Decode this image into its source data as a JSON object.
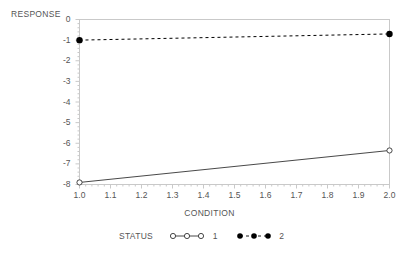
{
  "chart_data": {
    "type": "line",
    "title": "",
    "xlabel": "CONDITION",
    "ylabel": "RESPONSE",
    "xlim": [
      1.0,
      2.0
    ],
    "ylim": [
      -8,
      0
    ],
    "grid": false,
    "legend_position": "bottom",
    "legend_title": "STATUS",
    "x": [
      1.0,
      2.0
    ],
    "xticks": [
      "1.0",
      "1.1",
      "1.2",
      "1.3",
      "1.4",
      "1.5",
      "1.6",
      "1.7",
      "1.8",
      "1.9",
      "2.0"
    ],
    "yticks": [
      "0",
      "-1",
      "-2",
      "-3",
      "-4",
      "-5",
      "-6",
      "-7",
      "-8"
    ],
    "series": [
      {
        "name": "1",
        "values": [
          -7.9,
          -6.35
        ],
        "marker": "open-circle",
        "line": "solid",
        "color": "#333333"
      },
      {
        "name": "2",
        "values": [
          -1.0,
          -0.7
        ],
        "marker": "filled-circle",
        "line": "dashed",
        "color": "#000000"
      }
    ]
  },
  "axes": {
    "y_title": "RESPONSE",
    "x_title": "CONDITION"
  },
  "legend": {
    "title": "STATUS",
    "entries": [
      {
        "label": "1"
      },
      {
        "label": "2"
      }
    ]
  },
  "colors": {
    "frame": "#c9c9c9",
    "text": "#555555",
    "series1": "#333333",
    "series2": "#000000"
  }
}
